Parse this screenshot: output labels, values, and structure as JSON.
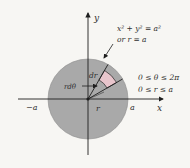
{
  "diagram": {
    "colors": {
      "background": "#f7f6f3",
      "disk_fill": "#a9a9a9",
      "patch_fill": "#e8c5cc",
      "line": "#1e1e1e",
      "text": "#2f2f2f"
    },
    "axes": {
      "x_label": "x",
      "y_label": "y",
      "pos_a_label": "a",
      "neg_a_label": "−a"
    },
    "equation": {
      "line1": "x² + y² = a²",
      "line2": "or r = a"
    },
    "bounds": {
      "theta": "0 ≤ θ ≤ 2π",
      "r": "0 ≤ r ≤ a"
    },
    "element_labels": {
      "dr": "dr",
      "r_dtheta": "rdθ",
      "r": "r"
    }
  }
}
